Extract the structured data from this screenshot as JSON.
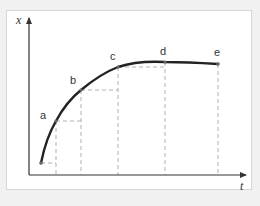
{
  "diagram": {
    "axes": {
      "y_label": "x",
      "x_label": "t"
    },
    "points": [
      {
        "id": "start",
        "label": "",
        "x": 41,
        "y": 163
      },
      {
        "id": "a",
        "label": "a",
        "x": 56,
        "y": 121
      },
      {
        "id": "b",
        "label": "b",
        "x": 81,
        "y": 90
      },
      {
        "id": "c",
        "label": "c",
        "x": 118,
        "y": 67
      },
      {
        "id": "d",
        "label": "d",
        "x": 165,
        "y": 62
      },
      {
        "id": "e",
        "label": "e",
        "x": 218,
        "y": 64
      }
    ],
    "colors": {
      "curve": "#222222",
      "dashed": "#b0b0b0",
      "axis": "#333333",
      "frame_border": "#d6d6d6",
      "background": "#f1f1f1"
    }
  }
}
